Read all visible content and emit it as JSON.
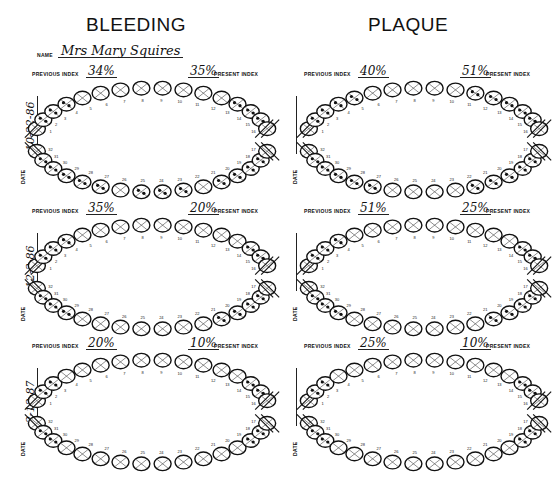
{
  "columns": [
    {
      "id": "bleeding",
      "title": "BLEEDING"
    },
    {
      "id": "plaque",
      "title": "PLAQUE"
    }
  ],
  "patient": {
    "name_label": "NAME",
    "name": "Mrs Mary Squires"
  },
  "labels": {
    "previous_index": "PREVIOUS INDEX",
    "present_index": "PRESENT INDEX",
    "date": "DATE"
  },
  "tooth_numbers": {
    "upper": [
      "1",
      "2",
      "3",
      "4",
      "5",
      "6",
      "7",
      "8",
      "9",
      "10",
      "11",
      "12",
      "13",
      "14",
      "15",
      "16"
    ],
    "lower": [
      "32",
      "31",
      "30",
      "29",
      "28",
      "27",
      "26",
      "25",
      "24",
      "23",
      "22",
      "21",
      "20",
      "19",
      "18",
      "17"
    ]
  },
  "charts": [
    {
      "column": "bleeding",
      "row": 1,
      "date": "10-22-86",
      "previous_index": "34%",
      "present_index": "35%",
      "missing": [
        "1",
        "16",
        "32",
        "17"
      ],
      "marked_upper": [
        2,
        3,
        4,
        13,
        14,
        15
      ],
      "marked_lower": [
        31,
        30,
        29,
        28,
        27,
        25,
        24,
        23,
        21,
        20,
        19,
        18
      ]
    },
    {
      "column": "plaque",
      "row": 1,
      "date": "",
      "previous_index": "40%",
      "present_index": "51%",
      "missing": [
        "1",
        "16",
        "32",
        "17"
      ],
      "marked_upper": [
        2,
        3,
        4,
        5,
        11,
        12,
        13,
        14,
        15
      ],
      "marked_lower": [
        31,
        30,
        29,
        28,
        27,
        22,
        21,
        20,
        19,
        18
      ]
    },
    {
      "column": "bleeding",
      "row": 2,
      "date": "12-3-86",
      "previous_index": "35%",
      "present_index": "20%",
      "missing": [
        "1",
        "16",
        "32",
        "17"
      ],
      "marked_upper": [
        2,
        3,
        4,
        14,
        15
      ],
      "marked_lower": [
        31,
        30,
        29,
        21,
        20,
        19,
        18
      ]
    },
    {
      "column": "plaque",
      "row": 2,
      "date": "",
      "previous_index": "51%",
      "present_index": "25%",
      "missing": [
        "1",
        "16",
        "32",
        "17"
      ],
      "marked_upper": [
        2,
        3,
        4,
        14,
        15
      ],
      "marked_lower": [
        31,
        30,
        29,
        21,
        20,
        19,
        18
      ]
    },
    {
      "column": "bleeding",
      "row": 3,
      "date": "2-12-87",
      "previous_index": "20%",
      "present_index": "10%",
      "missing": [
        "1",
        "16",
        "32",
        "17"
      ],
      "marked_upper": [
        2,
        3,
        14,
        15
      ],
      "marked_lower": [
        31,
        30,
        19,
        18
      ]
    },
    {
      "column": "plaque",
      "row": 3,
      "date": "",
      "previous_index": "25%",
      "present_index": "10%",
      "missing": [
        "1",
        "16",
        "32",
        "17"
      ],
      "marked_upper": [
        2,
        3,
        14,
        15
      ],
      "marked_lower": [
        31,
        30,
        19,
        18
      ]
    }
  ]
}
